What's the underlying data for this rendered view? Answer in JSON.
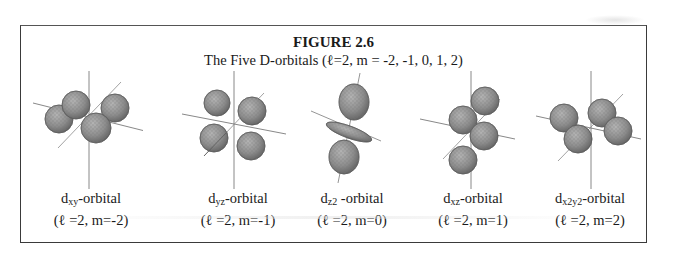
{
  "figure": {
    "title": "FIGURE 2.6",
    "subtitle": "The Five D-orbitals (ℓ=2, m = -2, -1, 0, 1, 2)"
  },
  "orbitals": [
    {
      "name": "dxy",
      "sub": "xy",
      "suffix": "-orbital",
      "params": "(ℓ =2, m=-2)"
    },
    {
      "name": "dyz",
      "sub": "yz",
      "suffix": "-orbital",
      "params": "(ℓ =2, m=-1)"
    },
    {
      "name": "dz2",
      "sub": "z2",
      "suffix": " -orbital",
      "params": "(ℓ =2, m=0)"
    },
    {
      "name": "dxz",
      "sub": "xz",
      "suffix": "-orbital",
      "params": "(ℓ =2, m=1)"
    },
    {
      "name": "dx2y2",
      "sub": "x2y2",
      "suffix": "-orbital",
      "params": "(ℓ =2, m=2)"
    }
  ],
  "colors": {
    "lobe_fill": "#8f8f8f",
    "lobe_stroke": "#5a5a5a",
    "axis": "#6a6a6a",
    "border": "#3a3a3a"
  }
}
